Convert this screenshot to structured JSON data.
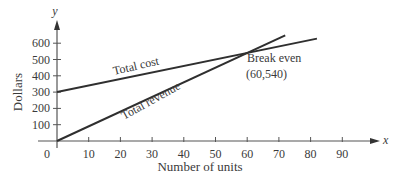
{
  "chart_data": {
    "type": "line",
    "title": "",
    "xlabel": "Number of units",
    "ylabel": "Dollars",
    "x_axis_symbol": "x",
    "y_axis_symbol": "y",
    "xlim": [
      0,
      95
    ],
    "ylim": [
      0,
      650
    ],
    "x_ticks": [
      0,
      10,
      20,
      30,
      40,
      50,
      60,
      70,
      80,
      90
    ],
    "x_tick_labels": [
      "0",
      "10",
      "20",
      "30",
      "40",
      "50",
      "60",
      "70",
      "80",
      "90"
    ],
    "y_ticks": [
      100,
      200,
      300,
      400,
      500,
      600
    ],
    "y_tick_labels": [
      "100",
      "200",
      "300",
      "400",
      "500",
      "600"
    ],
    "grid": false,
    "series": [
      {
        "name": "Total cost",
        "x": [
          0,
          82
        ],
        "values": [
          300,
          628
        ],
        "equation": "C = 300 + 4x"
      },
      {
        "name": "Total revenue",
        "x": [
          0,
          72
        ],
        "values": [
          0,
          648
        ],
        "equation": "R = 9x"
      }
    ],
    "annotations": [
      {
        "text": "Break even",
        "x": 60,
        "y": 540
      },
      {
        "text": "(60,540)",
        "x": 60,
        "y": 540
      }
    ]
  },
  "labels": {
    "origin": "0",
    "total_cost": "Total cost",
    "total_revenue": "Total revenue",
    "break_even": "Break even",
    "break_even_point": "(60,540)"
  }
}
